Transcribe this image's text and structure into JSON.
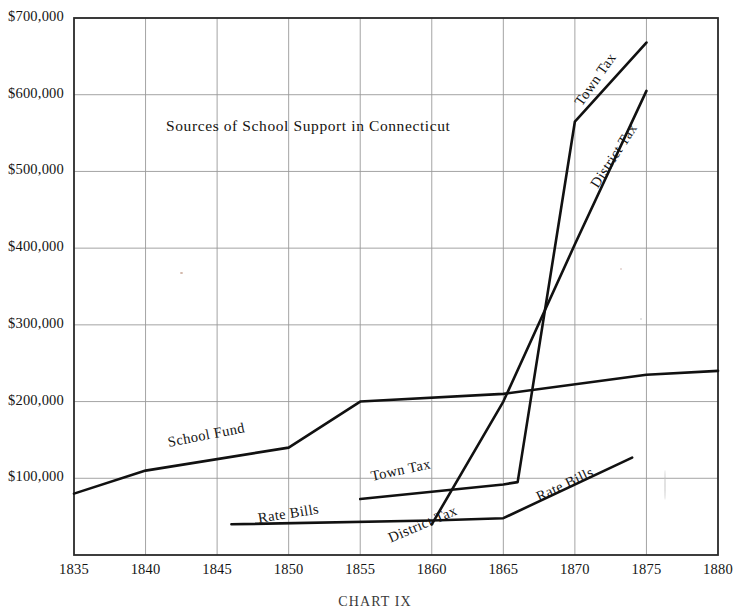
{
  "chart_data": {
    "type": "line",
    "title": "Sources of School Support in Connecticut",
    "caption": "CHART IX",
    "xlabel": "",
    "ylabel": "",
    "xlim": [
      1835,
      1880
    ],
    "ylim": [
      0,
      700000
    ],
    "grid": true,
    "legend_position": "inline-along-curves",
    "xticks": [
      1835,
      1840,
      1845,
      1850,
      1855,
      1860,
      1865,
      1870,
      1875,
      1880
    ],
    "xtick_labels": [
      "1835",
      "1840",
      "1845",
      "1850",
      "1855",
      "1860",
      "1865",
      "1870",
      "1875",
      "1880"
    ],
    "yticks": [
      100000,
      200000,
      300000,
      400000,
      500000,
      600000,
      700000
    ],
    "ytick_labels": [
      "$100,000",
      "$200,000",
      "$300,000",
      "$400,000",
      "$500,000",
      "$600,000",
      "$700,000"
    ],
    "series": [
      {
        "name": "School Fund",
        "label": "School Fund",
        "x": [
          1835,
          1840,
          1850,
          1855,
          1865,
          1875,
          1880
        ],
        "values": [
          80000,
          110000,
          140000,
          200000,
          210000,
          235000,
          240000
        ]
      },
      {
        "name": "Town Tax",
        "label": "Town Tax",
        "x": [
          1855,
          1865,
          1866,
          1870,
          1875
        ],
        "values": [
          73000,
          92000,
          95000,
          565000,
          668000
        ]
      },
      {
        "name": "District Tax",
        "label": "District Tax",
        "x": [
          1860,
          1865,
          1870,
          1875
        ],
        "values": [
          40000,
          200000,
          405000,
          605000
        ]
      },
      {
        "name": "Rate Bills",
        "label": "Rate Bills",
        "x": [
          1846,
          1860,
          1865,
          1874
        ],
        "values": [
          40000,
          45000,
          48000,
          127000
        ]
      }
    ]
  }
}
